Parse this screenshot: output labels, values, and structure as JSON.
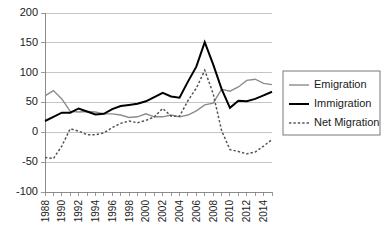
{
  "chart_data": {
    "type": "line",
    "title": "",
    "xlabel": "",
    "ylabel": "",
    "ylim": [
      -100,
      200
    ],
    "ytick_values": [
      200,
      150,
      100,
      50,
      0,
      -50,
      -100
    ],
    "ytick_labels": [
      "200",
      "150",
      "100",
      "50",
      "0",
      "-50",
      "-100"
    ],
    "grid": true,
    "legend_position": "right",
    "x": [
      1988,
      1989,
      1990,
      1991,
      1992,
      1993,
      1994,
      1995,
      1996,
      1997,
      1998,
      1999,
      2000,
      2001,
      2002,
      2003,
      2004,
      2005,
      2006,
      2007,
      2008,
      2009,
      2010,
      2011,
      2012,
      2013,
      2014,
      2015
    ],
    "xtick_labels": [
      "1988",
      "",
      "1990",
      "",
      "1992",
      "",
      "1994",
      "",
      "1996",
      "",
      "1998",
      "",
      "2000",
      "",
      "2002",
      "",
      "2004",
      "",
      "2006",
      "",
      "2008",
      "",
      "2010",
      "",
      "2012",
      "",
      "2014",
      ""
    ],
    "xtick_shown": [
      "1988",
      "1990",
      "1992",
      "1994",
      "1996",
      "1998",
      "2000",
      "2002",
      "2004",
      "2006",
      "2008",
      "2010",
      "2012",
      "2014"
    ],
    "series": [
      {
        "name": "Emigration",
        "color": "#8c8c8c",
        "style": "solid",
        "width": 1.4,
        "values": [
          61,
          70,
          56,
          35,
          34,
          35,
          34,
          31,
          31,
          29,
          25,
          26,
          31,
          26,
          26,
          29,
          26,
          29,
          36,
          46,
          49,
          72,
          69,
          76,
          87,
          89,
          82,
          80
        ]
      },
      {
        "name": "Immigration",
        "color": "#000000",
        "style": "solid",
        "width": 2.0,
        "values": [
          19,
          26,
          33,
          33,
          40,
          35,
          30,
          31,
          39,
          44,
          46,
          48,
          52,
          59,
          66,
          60,
          58,
          85,
          110,
          151,
          114,
          73,
          41,
          53,
          52,
          56,
          62,
          68
        ]
      },
      {
        "name": "Net Migration",
        "color": "#555555",
        "style": "dotted",
        "width": 1.5,
        "values": [
          -42,
          -44,
          -23,
          6,
          2,
          -4,
          -4,
          -1,
          8,
          15,
          19,
          16,
          20,
          26,
          40,
          27,
          27,
          53,
          74,
          104,
          65,
          3,
          -29,
          -32,
          -36,
          -33,
          -23,
          -12
        ]
      }
    ]
  },
  "legend": {
    "items": [
      {
        "label": "Emigration"
      },
      {
        "label": "Immigration"
      },
      {
        "label": "Net Migration"
      }
    ]
  }
}
